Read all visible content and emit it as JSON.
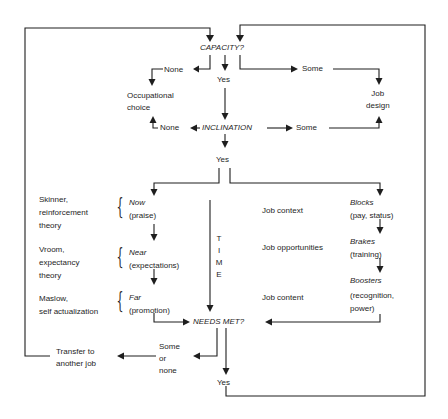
{
  "nodes": {
    "capacity": "CAPACITY?",
    "capacity_none": "None",
    "capacity_yes": "Yes",
    "capacity_some": "Some",
    "occupational_choice": "Occupational\nchoice",
    "job_design": "Job\ndesign",
    "inclination": "INCLINATION",
    "inclination_none": "None",
    "inclination_some": "Some",
    "inclination_yes": "Yes",
    "needs_met": "NEEDS MET?",
    "needs_some_or_none": "Some\nor\nnone",
    "needs_yes": "Yes",
    "transfer": "Transfer to\nanother job"
  },
  "left_column": {
    "theories": [
      {
        "label": "Skinner,\nreinforcement\ntheory",
        "stage": "Now",
        "detail": "(praise)"
      },
      {
        "label": "Vroom,\nexpectancy\ntheory",
        "stage": "Near",
        "detail": "(expectations)"
      },
      {
        "label": "Maslow,\nself actualization",
        "stage": "Far",
        "detail": "(promotion)"
      }
    ]
  },
  "time_axis": {
    "letters": [
      "T",
      "I",
      "M",
      "E"
    ]
  },
  "right_column": {
    "factors": [
      {
        "label": "Job context",
        "stage": "Blocks",
        "detail": "(pay, status)"
      },
      {
        "label": "Job opportunities",
        "stage": "Brakes",
        "detail": "(training)"
      },
      {
        "label": "Job content",
        "stage": "Boosters",
        "detail": "(recognition,\npower)"
      }
    ]
  }
}
